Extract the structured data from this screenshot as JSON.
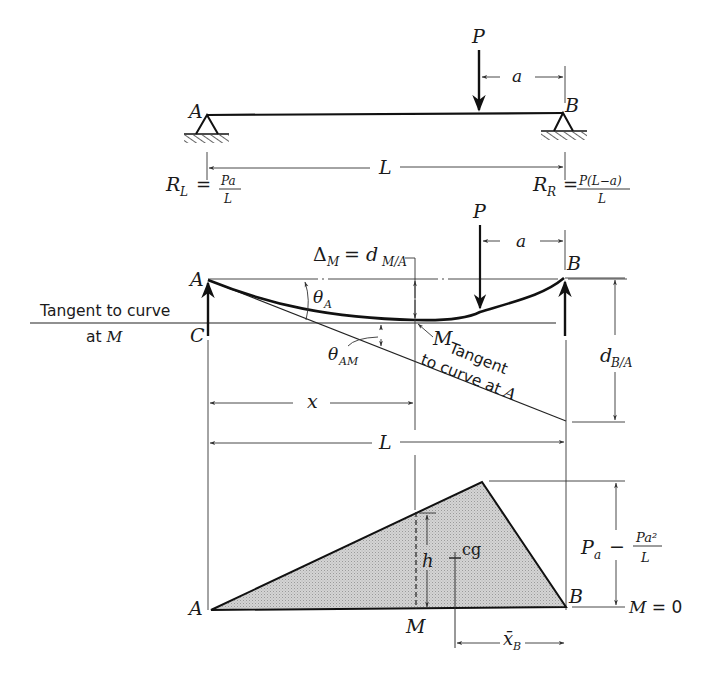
{
  "figure": {
    "panel_loading": {
      "left_support_label": "A",
      "right_support_label": "B",
      "load_label": "P",
      "load_offset_label": "a",
      "span_label": "L",
      "left_reaction": {
        "symbol": "R",
        "sub": "L",
        "eq": "=",
        "num": "Pa",
        "den": "L"
      },
      "right_reaction": {
        "symbol": "R",
        "sub": "R",
        "eq": "=",
        "num": "P(L−a)",
        "den": "L"
      }
    },
    "panel_deflection": {
      "left_point_label": "A",
      "right_point_label": "B",
      "point_c_label": "C",
      "point_m_label": "M",
      "load_label": "P",
      "load_offset_label": "a",
      "delta_m": {
        "symbol": "Δ",
        "sub": "M",
        "eq": "= d",
        "sub2": "M/A"
      },
      "theta_a": {
        "symbol": "θ",
        "sub": "A"
      },
      "theta_am": {
        "symbol": "θ",
        "sub": "AM"
      },
      "tangent_m_line1": "Tangent to curve",
      "tangent_m_line2_prefix": "at ",
      "tangent_m_line2_var": "M",
      "tangent_a_line1": "Tangent",
      "tangent_a_line2_prefix": "to curve at ",
      "tangent_a_line2_var": "A",
      "d_ba": {
        "symbol": "d",
        "sub": "B/A"
      },
      "x_label": "x",
      "span_label": "L"
    },
    "panel_moment": {
      "left_label": "A",
      "right_label": "B",
      "m_label": "M",
      "h_label": "h",
      "cg_label": "cg",
      "xbar": {
        "symbol": "x̄",
        "sub": "B"
      },
      "peak_expr": {
        "first": "P",
        "first_sub": "a",
        "minus": "−",
        "num": "Pa²",
        "den": "L"
      },
      "zero_moment": {
        "var": "M",
        "rest": " = 0"
      }
    }
  }
}
